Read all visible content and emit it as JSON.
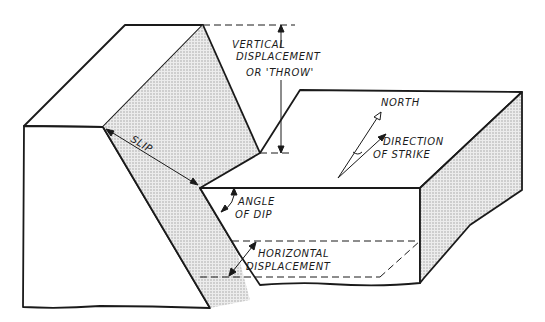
{
  "diagram": {
    "labels": {
      "vertical_1": "VERTICAL",
      "vertical_2": "DISPLACEMENT",
      "vertical_3": "OR 'THROW'",
      "north": "NORTH",
      "strike_1": "DIRECTION",
      "strike_2": "OF STRIKE",
      "slip": "SLIP",
      "dip_1": "ANGLE",
      "dip_2": "OF DIP",
      "horizontal_1": "HORIZONTAL",
      "horizontal_2": "DISPLACEMENT"
    },
    "colors": {
      "line": "#1a1a1a",
      "shade": "#d9d9d9",
      "background": "#ffffff"
    }
  }
}
